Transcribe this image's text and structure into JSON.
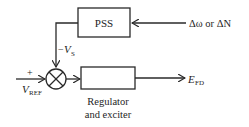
{
  "diagram": {
    "type": "block-diagram",
    "blocks": [
      {
        "id": "pss",
        "label": "PSS"
      },
      {
        "id": "regulator",
        "label": "",
        "caption_line1": "Regulator",
        "caption_line2": "and exciter"
      }
    ],
    "summing_junction": {
      "inputs": [
        "+V_REF",
        "-V_S"
      ]
    },
    "signals": {
      "input_pss": "Δω or ΔN",
      "feedback_sign": "−",
      "feedback_symbol": "V",
      "feedback_sub": "S",
      "ref_sign": "+",
      "ref_symbol": "V",
      "ref_sub": "REF",
      "output_symbol": "E",
      "output_sub": "FD"
    }
  }
}
